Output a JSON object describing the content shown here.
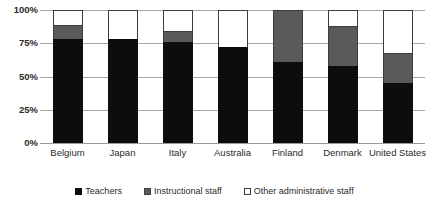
{
  "chart_data": {
    "type": "bar",
    "subtype": "stacked-100-percent",
    "title": "",
    "xlabel": "",
    "ylabel": "",
    "ylim": [
      0,
      100
    ],
    "y_tick_labels": [
      "100%",
      "75%",
      "50%",
      "25%",
      "0%"
    ],
    "y_tick_values": [
      100,
      75,
      50,
      25,
      0
    ],
    "grid": true,
    "legend_position": "bottom",
    "categories": [
      "Belgium",
      "Japan",
      "Italy",
      "Australia",
      "Finland",
      "Denmark",
      "United States"
    ],
    "series": [
      {
        "name": "Teachers",
        "color": "#0d0d0d",
        "values": [
          78,
          78,
          76,
          72,
          61,
          58,
          45
        ]
      },
      {
        "name": "Instructional staff",
        "color": "#5a5a5a",
        "values": [
          11,
          0,
          8,
          0,
          39,
          30,
          23
        ]
      },
      {
        "name": "Other administrative staff",
        "color": "#ffffff",
        "values": [
          11,
          22,
          16,
          28,
          0,
          12,
          32
        ]
      }
    ]
  },
  "legend": {
    "items": [
      {
        "label": "Teachers",
        "swatch": "teachers"
      },
      {
        "label": "Instructional staff",
        "swatch": "instructional"
      },
      {
        "label": "Other administrative staff",
        "swatch": "other"
      }
    ]
  }
}
